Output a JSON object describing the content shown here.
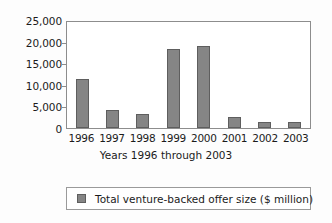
{
  "chart_data": {
    "type": "bar",
    "title": "",
    "subtitle": "",
    "xlabel": "Years 1996 through 2003",
    "ylabel": "",
    "categories": [
      "1996",
      "1997",
      "1998",
      "1999",
      "2000",
      "2001",
      "2002",
      "2003"
    ],
    "values": [
      11280,
      4200,
      3270,
      18290,
      19090,
      2570,
      1430,
      1500
    ],
    "series": [
      {
        "name": "Total venture-backed offer size ($ million)",
        "values": [
          11280,
          4200,
          3270,
          18290,
          19090,
          2570,
          1430,
          1500
        ]
      }
    ],
    "ylim": [
      0,
      25000
    ],
    "ytick_values": [
      25000,
      20000,
      15000,
      10000,
      5000,
      0
    ],
    "ytick_labels": [
      "25,000",
      "20,000",
      "15,000",
      "10,000",
      "5,000",
      "0"
    ],
    "grid": false,
    "legend_position": "bottom",
    "bar_color": "#858585",
    "bar_border_color": "#5e5e5e",
    "axis_color": "#8d8d8d",
    "text_color": "#1b1b1b",
    "plot_background": "#ffffff"
  },
  "legend": {
    "entries": [
      {
        "label": "Total venture-backed offer size ($ million)",
        "swatch_name": "legend-swatch-series-1"
      }
    ]
  }
}
